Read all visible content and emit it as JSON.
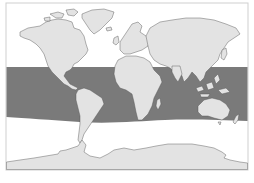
{
  "map": {
    "projection": "world equirectangular",
    "colors": {
      "ocean": "#ffffff",
      "land": "#e3e3e3",
      "highlight_band": "#7a7a7a",
      "coastline": "#555555",
      "frame": "#cfcfcf"
    },
    "highlight_region": {
      "description": "tropical latitude band shaded dark across all oceans",
      "latitude_north_approx": 35,
      "latitude_south_approx": -35
    },
    "regions": [
      "North America",
      "Greenland",
      "South America",
      "Europe",
      "Africa",
      "Madagascar",
      "Asia",
      "Maritime Southeast Asia",
      "Australia",
      "New Zealand",
      "Antarctica"
    ]
  }
}
